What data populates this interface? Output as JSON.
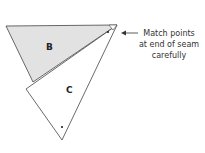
{
  "diagram": {
    "pieces": [
      {
        "id": "B",
        "label": "B",
        "fill": "#e2e2e2"
      },
      {
        "id": "C",
        "label": "C",
        "fill": "#ffffff"
      }
    ],
    "annotation": {
      "lines": [
        "Match points",
        "at end of seam",
        "carefully"
      ]
    },
    "colors": {
      "stroke": "#444444",
      "shaded": "#e2e2e2",
      "text": "#333333"
    }
  }
}
